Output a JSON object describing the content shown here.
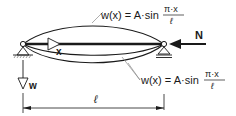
{
  "diagram": {
    "type": "buckled-column-euler",
    "upper_formula": {
      "lhs": "w(x) = A·sin",
      "frac_num": "π·x",
      "frac_den": "ℓ"
    },
    "lower_formula": {
      "lhs": "w(x) = A·sin",
      "frac_num": "π·x",
      "frac_den": "ℓ"
    },
    "axis_x_label": "x",
    "axis_w_label": "w",
    "force_label": "N",
    "span_label": "ℓ",
    "colors": {
      "line": "#1a1a1a",
      "leader": "#8a8a8a",
      "background": "#ffffff"
    }
  }
}
